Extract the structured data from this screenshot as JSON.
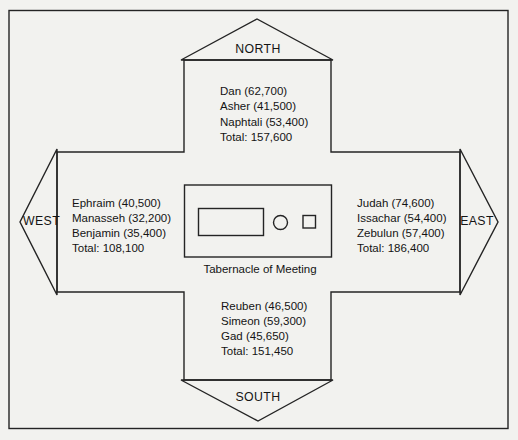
{
  "figure": {
    "center_label": "Tabernacle of Meeting",
    "compass": {
      "north": "NORTH",
      "south": "SOUTH",
      "east": "EAST",
      "west": "WEST"
    },
    "camps": {
      "north": {
        "tribes": [
          "Dan (62,700)",
          "Asher (41,500)",
          "Naphtali (53,400)"
        ],
        "total": "Total: 157,600"
      },
      "east": {
        "tribes": [
          "Judah (74,600)",
          "Issachar (54,400)",
          "Zebulun (57,400)"
        ],
        "total": "Total: 186,400"
      },
      "south": {
        "tribes": [
          "Reuben (46,500)",
          "Simeon (59,300)",
          "Gad (45,650)"
        ],
        "total": "Total: 151,450"
      },
      "west": {
        "tribes": [
          "Ephraim (40,500)",
          "Manasseh (32,200)",
          "Benjamin (35,400)"
        ],
        "total": "Total: 108,100"
      }
    },
    "colors": {
      "line": "#242424",
      "text": "#141414",
      "paper": "#f2f2ef"
    }
  }
}
